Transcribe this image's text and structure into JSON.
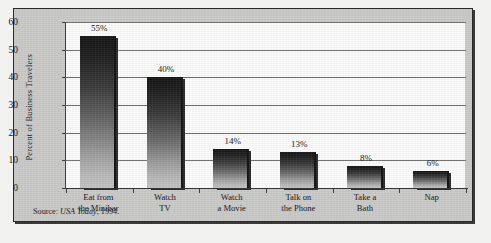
{
  "chart_data": {
    "type": "bar",
    "title": "",
    "xlabel": "",
    "ylabel": "Percent of Business Travelers",
    "ylim": [
      0,
      60
    ],
    "ytick_step": 10,
    "yticks": [
      "60",
      "50",
      "40",
      "30",
      "20",
      "10",
      "0"
    ],
    "grid": true,
    "legend": "none",
    "categories": [
      "Eat from\nthe Minibar",
      "Watch\nTV",
      "Watch\na Movie",
      "Talk on\nthe Phone",
      "Take a\nBath",
      "Nap"
    ],
    "category_lines": [
      [
        "Eat from",
        "the Minibar"
      ],
      [
        "Watch",
        "TV"
      ],
      [
        "Watch",
        "a Movie"
      ],
      [
        "Talk on",
        "the Phone"
      ],
      [
        "Take a",
        "Bath"
      ],
      [
        "Nap",
        ""
      ]
    ],
    "values": [
      55,
      40,
      14,
      13,
      8,
      6
    ],
    "data_labels": [
      "55%",
      "40%",
      "14%",
      "13%",
      "8%",
      "6%"
    ],
    "bar_style": "vertical gradient dark-to-light with drop shadow"
  },
  "source_note": {
    "prefix": "Source: ",
    "publication": "USA Today",
    "suffix": ", 1994."
  },
  "colors": {
    "panel": "#c9c9c7",
    "plot_background": "#fbfbfa",
    "frame_border": "#2a2a2a",
    "gridline": "#6f6f6f",
    "bar_dark": "#141414",
    "bar_light": "#c2c2c2",
    "text": "#141414"
  }
}
